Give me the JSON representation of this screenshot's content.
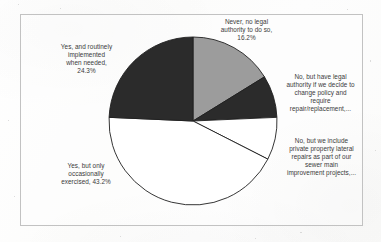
{
  "figure": {
    "background_color": "#fdfdfc",
    "frame_color": "#c2c2c2"
  },
  "labels": {
    "never": "Never, no legal\nauthority to do so,\n16.2%",
    "routinely": "Yes, and routinely\nimplemented\nwhen needed,\n24.3%",
    "occasionally": "Yes, but only\noccasionally\nexercised, 43.2%",
    "legal_authority": "No, but have legal\nauthority if we decide to\nchange policy and\nrequire\nrepair/replacement,...",
    "sewer_main": "No, but we include\nprivate property lateral\nrepairs as part of our\nsewer main\nimprovement projects,..."
  },
  "chart_data": {
    "type": "pie",
    "title": "",
    "subtitle": "",
    "xlabel": "",
    "ylabel": "",
    "grid": false,
    "legend_position": "outside-labels",
    "label_format": "category, percent",
    "start_angle_deg": 90,
    "direction": "clockwise",
    "center_px": [
      193,
      121
    ],
    "radius_px": 84,
    "categories": [
      "Never, no legal authority to do so",
      "No, but have legal authority if we decide to change policy and require repair/replacement,...",
      "No, but we include private property lateral repairs as part of our sewer main improvement projects,...",
      "Yes, but only occasionally exercised",
      "Yes, and routinely implemented when needed"
    ],
    "values": [
      16.2,
      8.1,
      8.2,
      43.2,
      24.3
    ],
    "value_labels": [
      "16.2%",
      "",
      "",
      "43.2%",
      "24.3%"
    ],
    "colors": [
      "#9c9c9c",
      "#2b2b2b",
      "#ffffff",
      "#ffffff",
      "#2b2b2b"
    ],
    "slice_edge_color": "#1f1f1f",
    "unlabeled_percent_note": "two 'No, but...' slices have no printed percentage"
  },
  "slices": [
    {
      "name": "never",
      "percent": 16.2,
      "fill": "#9c9c9c",
      "start_deg": 0.0,
      "end_deg": 58.3
    },
    {
      "name": "legal_authority",
      "percent": 8.1,
      "fill": "#2b2b2b",
      "start_deg": 58.3,
      "end_deg": 87.5
    },
    {
      "name": "sewer_main",
      "percent": 8.2,
      "fill": "#ffffff",
      "start_deg": 87.5,
      "end_deg": 117.0
    },
    {
      "name": "occasionally",
      "percent": 43.2,
      "fill": "#ffffff",
      "start_deg": 117.0,
      "end_deg": 272.5
    },
    {
      "name": "routinely",
      "percent": 24.3,
      "fill": "#2b2b2b",
      "start_deg": 272.5,
      "end_deg": 360.0
    }
  ]
}
